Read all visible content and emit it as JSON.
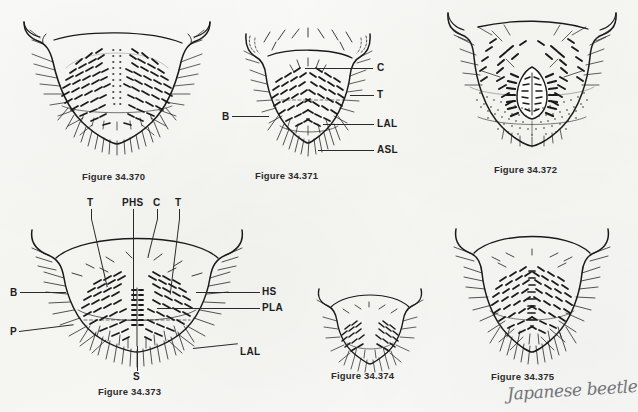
{
  "plate": {
    "title": "Plate of beetle terminalia figures 34.370-34.375",
    "background_color": "#f7f7f5",
    "ink_color": "#1a1a1a"
  },
  "figures": [
    {
      "id": "34-370",
      "caption": "Figure 34.370",
      "labels": []
    },
    {
      "id": "34-371",
      "caption": "Figure 34.371",
      "labels": [
        {
          "text": "C",
          "name": "label-c"
        },
        {
          "text": "T",
          "name": "label-t"
        },
        {
          "text": "LAL",
          "name": "label-lal"
        },
        {
          "text": "ASL",
          "name": "label-asl"
        },
        {
          "text": "B",
          "name": "label-b"
        }
      ]
    },
    {
      "id": "34-372",
      "caption": "Figure 34.372",
      "labels": []
    },
    {
      "id": "34-373",
      "caption": "Figure 34.373",
      "labels": [
        {
          "text": "T",
          "name": "label-t-left"
        },
        {
          "text": "PHS",
          "name": "label-phs"
        },
        {
          "text": "C",
          "name": "label-c"
        },
        {
          "text": "T",
          "name": "label-t-right"
        },
        {
          "text": "HS",
          "name": "label-hs"
        },
        {
          "text": "PLA",
          "name": "label-pla"
        },
        {
          "text": "LAL",
          "name": "label-lal"
        },
        {
          "text": "B",
          "name": "label-b"
        },
        {
          "text": "P",
          "name": "label-p"
        },
        {
          "text": "S",
          "name": "label-s"
        }
      ]
    },
    {
      "id": "34-374",
      "caption": "Figure 34.374",
      "labels": []
    },
    {
      "id": "34-375",
      "caption": "Figure 34.375",
      "labels": []
    }
  ],
  "annotation": {
    "handwritten_note": "Japanese beetle"
  },
  "labels_flat": {
    "f371_c": "C",
    "f371_t": "T",
    "f371_lal": "LAL",
    "f371_asl": "ASL",
    "f371_b": "B",
    "f373_t_left": "T",
    "f373_phs": "PHS",
    "f373_c": "C",
    "f373_t_right": "T",
    "f373_hs": "HS",
    "f373_pla": "PLA",
    "f373_lal": "LAL",
    "f373_b": "B",
    "f373_p": "P",
    "f373_s": "S"
  },
  "captions_flat": {
    "f370": "Figure 34.370",
    "f371": "Figure 34.371",
    "f372": "Figure 34.372",
    "f373": "Figure 34.373",
    "f374": "Figure 34.374",
    "f375": "Figure 34.375"
  }
}
